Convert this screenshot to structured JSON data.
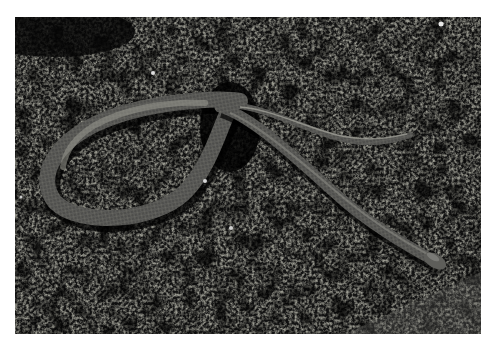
{
  "image": {
    "subject": "snake on moss",
    "frame": {
      "x": 15,
      "y": 17,
      "width": 466,
      "height": 317
    },
    "colors": {
      "background_page": "#ffffff",
      "moss_dark": "#0c0c0c",
      "moss_light": "#8a8a80",
      "snake_body": "#5a5a58",
      "snake_belly": "#9a9a92"
    }
  }
}
